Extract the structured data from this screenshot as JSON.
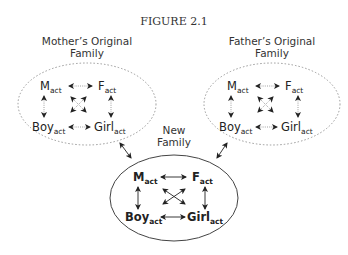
{
  "figure": {
    "title": "FIGURE 2.1",
    "families": [
      {
        "id": "mother",
        "label_line1": "Mother’s Original",
        "label_line2": "Family",
        "border": "dotted",
        "nodes": {
          "m": "M",
          "f": "F",
          "boy": "Boy",
          "girl": "Girl",
          "sub": "act"
        }
      },
      {
        "id": "father",
        "label_line1": "Father’s Original",
        "label_line2": "Family",
        "border": "dotted",
        "nodes": {
          "m": "M",
          "f": "F",
          "boy": "Boy",
          "girl": "Girl",
          "sub": "act"
        }
      },
      {
        "id": "new",
        "label_line1": "New",
        "label_line2": "Family",
        "border": "solid",
        "nodes": {
          "m": "M",
          "f": "F",
          "boy": "Boy",
          "girl": "Girl",
          "sub": "act"
        }
      }
    ],
    "connections": [
      {
        "from": "mother",
        "to": "new",
        "type": "bidirectional"
      },
      {
        "from": "father",
        "to": "new",
        "type": "bidirectional"
      }
    ],
    "colors": {
      "line": "#333333",
      "dotted": "#999999",
      "background": "#ffffff"
    }
  }
}
